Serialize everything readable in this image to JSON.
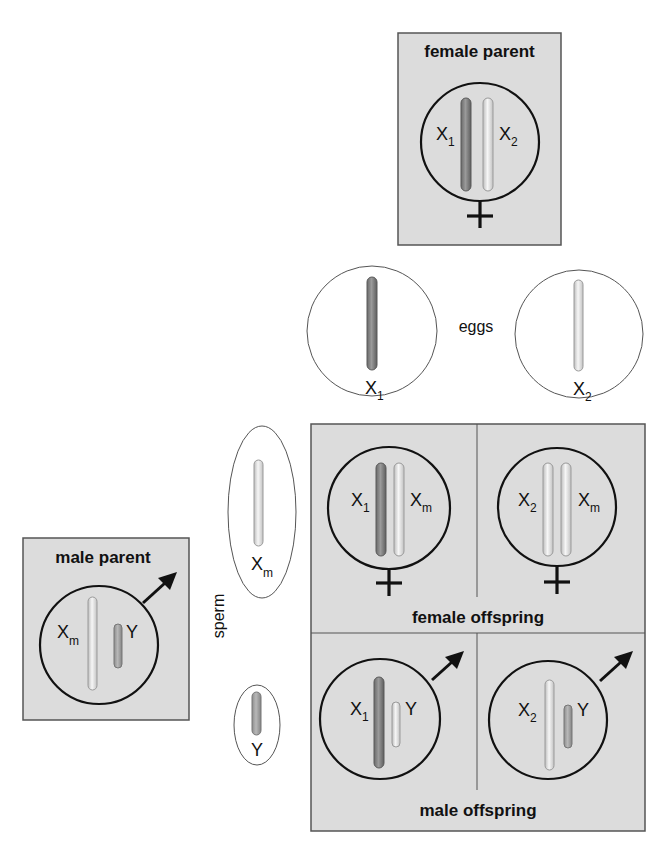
{
  "colors": {
    "panel_fill": "#dcdcdc",
    "panel_border": "#555555",
    "dark_chromosome": "#8a8a8a",
    "dark_chromosome_edge": "#5a5a5a",
    "light_chromosome": "#f2f2f2",
    "light_chromosome_edge": "#9a9a9a",
    "outline": "#111111"
  },
  "female_parent": {
    "label": "female parent",
    "symbol": "female-symbol",
    "chromosomes": [
      {
        "name": "X",
        "sub": "1",
        "shade": "dark"
      },
      {
        "name": "X",
        "sub": "2",
        "shade": "light"
      }
    ]
  },
  "eggs": {
    "label": "eggs",
    "items": [
      {
        "name": "X",
        "sub": "1",
        "shade": "dark"
      },
      {
        "name": "X",
        "sub": "2",
        "shade": "light"
      }
    ]
  },
  "male_parent": {
    "label": "male parent",
    "symbol": "male-symbol",
    "chromosomes": [
      {
        "name": "X",
        "sub": "m",
        "shade": "light"
      },
      {
        "name": "Y",
        "sub": "",
        "shade": "dark"
      }
    ]
  },
  "sperm": {
    "label": "sperm",
    "items": [
      {
        "name": "X",
        "sub": "m",
        "shade": "light"
      },
      {
        "name": "Y",
        "sub": "",
        "shade": "dark"
      }
    ]
  },
  "offspring": {
    "female_label": "female offspring",
    "male_label": "male offspring",
    "cells": [
      {
        "row": "female",
        "col": 1,
        "a": {
          "name": "X",
          "sub": "1"
        },
        "b": {
          "name": "X",
          "sub": "m"
        }
      },
      {
        "row": "female",
        "col": 2,
        "a": {
          "name": "X",
          "sub": "2"
        },
        "b": {
          "name": "X",
          "sub": "m"
        }
      },
      {
        "row": "male",
        "col": 1,
        "a": {
          "name": "X",
          "sub": "1"
        },
        "b": {
          "name": "Y",
          "sub": ""
        }
      },
      {
        "row": "male",
        "col": 2,
        "a": {
          "name": "X",
          "sub": "2"
        },
        "b": {
          "name": "Y",
          "sub": ""
        }
      }
    ]
  }
}
